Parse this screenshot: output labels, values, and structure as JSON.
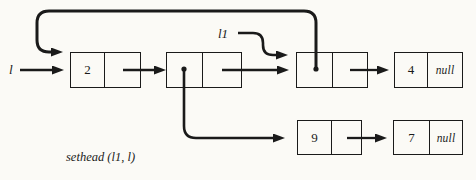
{
  "figure": {
    "background": "#fbfaf6",
    "ink": "#1a1a1a",
    "caption": "sethead (l1, l)",
    "label_l": "l",
    "label_l1": "l1",
    "nodes": [
      {
        "name": "node-2",
        "value": "2",
        "next": ""
      },
      {
        "name": "node-empty-mid",
        "value": "",
        "next": ""
      },
      {
        "name": "node-l1-target",
        "value": "",
        "next": ""
      },
      {
        "name": "node-4",
        "value": "4",
        "next": "null"
      },
      {
        "name": "node-9",
        "value": "9",
        "next": ""
      },
      {
        "name": "node-7",
        "value": "7",
        "next": "null"
      }
    ]
  }
}
